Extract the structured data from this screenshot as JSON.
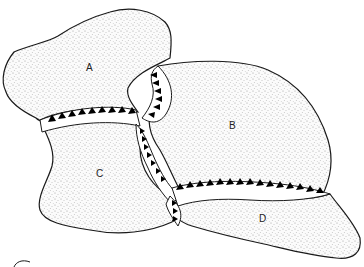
{
  "diagram": {
    "type": "geologic-block-diagram",
    "blocks": [
      {
        "id": "A",
        "label": "A"
      },
      {
        "id": "B",
        "label": "B"
      },
      {
        "id": "C",
        "label": "C"
      },
      {
        "id": "D",
        "label": "D"
      }
    ],
    "sutures": [
      {
        "name": "suture-A-C",
        "description": "toothed boundary between A and C"
      },
      {
        "name": "suture-A-B",
        "description": "toothed boundary between A and B"
      },
      {
        "name": "suture-B-C",
        "description": "vertical toothed boundary between B and C"
      },
      {
        "name": "suture-B-D",
        "description": "toothed boundary between B and D"
      }
    ],
    "colors": {
      "stipple": "#8a8a8a",
      "outline": "#1a1a1a",
      "teeth": "#000000",
      "background": "#ffffff"
    }
  }
}
